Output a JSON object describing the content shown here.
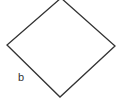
{
  "diagram": {
    "shape": "square rotated 45 degrees (rhombus)",
    "vertices": {
      "top": [
        61,
        -2
      ],
      "right": [
        115,
        46
      ],
      "bottom": [
        60,
        97
      ],
      "left": [
        7,
        45
      ]
    },
    "stroke_color": "#333333",
    "fill_color": "#ffffff",
    "labels": [
      {
        "text": "b",
        "side": "lower-left edge",
        "x": 18,
        "y": 81
      }
    ]
  }
}
